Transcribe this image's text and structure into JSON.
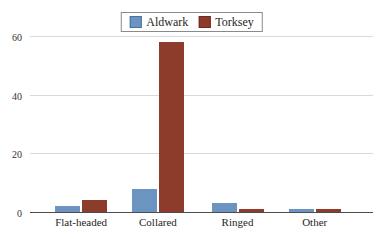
{
  "chart_data": {
    "type": "bar",
    "title": "",
    "xlabel": "",
    "ylabel": "",
    "categories": [
      "Flat-headed",
      "Collared",
      "Ringed",
      "Other"
    ],
    "series": [
      {
        "name": "Aldwark",
        "color": "#6c94c0",
        "swatch_border": "#4e719a",
        "values": [
          2,
          8,
          3,
          1
        ]
      },
      {
        "name": "Torksey",
        "color": "#8d3c2b",
        "swatch_border": "#6e2d1f",
        "values": [
          4,
          58,
          1,
          1
        ]
      }
    ],
    "ylim": [
      0,
      60
    ],
    "yticks": [
      0,
      20,
      40,
      60
    ],
    "legend_position": "top-center",
    "grid": true,
    "colors": {
      "background": "#ffffff",
      "gridline": "#d9d9d9",
      "axis_line": "#4d4d4d",
      "tick_text": "#333333",
      "category_text": "#262626",
      "legend_border": "#8a8a8a"
    },
    "group_centers_pct": [
      14.9,
      37.3,
      60.5,
      83.0
    ]
  }
}
